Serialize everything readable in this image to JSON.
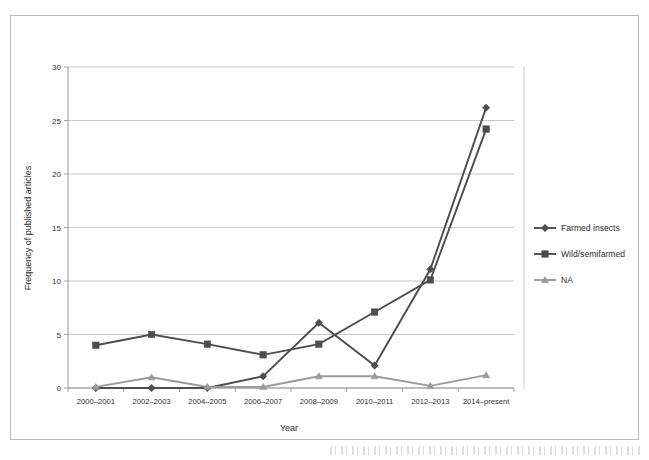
{
  "figure": {
    "background_color": "#ffffff",
    "frame_color": "#b9b9b9"
  },
  "chart_data": {
    "type": "line",
    "title": "",
    "subtitle": "",
    "xlabel": "Year",
    "ylabel": "Frequency of published articles",
    "categories": [
      "2000–2001",
      "2002–2003",
      "2004–2005",
      "2006–2007",
      "2008–2009",
      "2010–2011",
      "2012–2013",
      "2014–present"
    ],
    "series": [
      {
        "name": "Farmed insects",
        "marker": "diamond",
        "color": "#4d4d4d",
        "values": [
          0,
          0,
          0,
          1.1,
          6.1,
          2.1,
          11.1,
          26.2
        ]
      },
      {
        "name": "Wild/semifarmed",
        "marker": "square",
        "color": "#4d4d4d",
        "values": [
          4.0,
          5.0,
          4.1,
          3.1,
          4.1,
          7.1,
          10.1,
          24.2
        ]
      },
      {
        "name": "NA",
        "marker": "triangle",
        "color": "#9a9a9a",
        "values": [
          0.1,
          1.0,
          0.1,
          0.1,
          1.1,
          1.1,
          0.2,
          1.2
        ]
      }
    ],
    "ylim": [
      0,
      30
    ],
    "yticks": [
      0,
      5,
      10,
      15,
      20,
      25,
      30
    ],
    "ytick_labels": [
      "0",
      "5",
      "10",
      "15",
      "20",
      "25",
      "30"
    ],
    "grid": "horizontal",
    "legend_position": "right",
    "legend_entries": [
      "Farmed insects",
      "Wild/semifarmed",
      "NA"
    ]
  }
}
